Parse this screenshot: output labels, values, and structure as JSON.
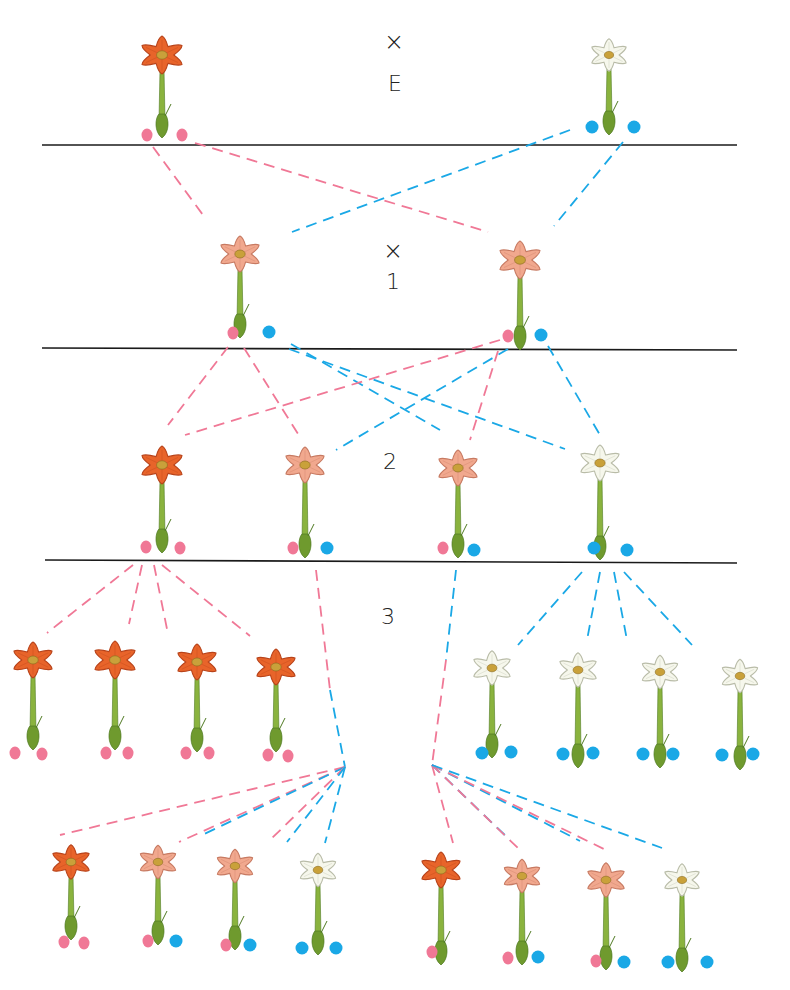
{
  "colors": {
    "red_allele": "#f07896",
    "white_allele": "#1aa8e6",
    "red_petal": "#e8642a",
    "red_petal_dark": "#b8431a",
    "pink_petal": "#f1a88e",
    "pink_petal_dark": "#c77a62",
    "white_petal": "#f6f7ec",
    "white_petal_dark": "#b9bca8",
    "stem": "#8ab33e",
    "stem_dark": "#4f7a22",
    "center": "#c9a13a",
    "divider": "#1a1a1a"
  },
  "labels": {
    "cross_symbol_1": "×",
    "parent_label": "E",
    "cross_symbol_2": "×",
    "gen1_label": "1",
    "gen2_label": "2",
    "gen3_label": "3"
  },
  "dividers": [
    {
      "x1": 42,
      "y1": 145,
      "x2": 737,
      "y2": 145
    },
    {
      "x1": 42,
      "y1": 348,
      "x2": 737,
      "y2": 350
    },
    {
      "x1": 45,
      "y1": 560,
      "x2": 737,
      "y2": 563
    }
  ],
  "flowers": [
    {
      "id": "P-red",
      "generation": "E",
      "color": "red",
      "x": 162,
      "y": 55,
      "stemBottom": 138,
      "size": 42,
      "alleles": [
        "red",
        "red"
      ],
      "dots": [
        [
          147,
          135
        ],
        [
          182,
          135
        ]
      ]
    },
    {
      "id": "P-white",
      "generation": "E",
      "color": "white",
      "x": 609,
      "y": 55,
      "stemBottom": 135,
      "size": 36,
      "alleles": [
        "white",
        "white"
      ],
      "dots": [
        [
          592,
          127
        ],
        [
          634,
          127
        ]
      ]
    },
    {
      "id": "F1-a",
      "generation": "1",
      "color": "pink",
      "x": 240,
      "y": 254,
      "stemBottom": 338,
      "size": 40,
      "alleles": [
        "red",
        "white"
      ],
      "dots": [
        [
          233,
          333
        ],
        [
          269,
          332
        ]
      ]
    },
    {
      "id": "F1-b",
      "generation": "1",
      "color": "pink",
      "x": 520,
      "y": 260,
      "stemBottom": 350,
      "size": 42,
      "alleles": [
        "red",
        "white"
      ],
      "dots": [
        [
          508,
          336
        ],
        [
          541,
          335
        ]
      ]
    },
    {
      "id": "F2-a",
      "generation": "2",
      "color": "red",
      "x": 162,
      "y": 465,
      "stemBottom": 553,
      "size": 42,
      "alleles": [
        "red",
        "red"
      ],
      "dots": [
        [
          146,
          547
        ],
        [
          180,
          548
        ]
      ]
    },
    {
      "id": "F2-b",
      "generation": "2",
      "color": "pink",
      "x": 305,
      "y": 465,
      "stemBottom": 558,
      "size": 40,
      "alleles": [
        "red",
        "white"
      ],
      "dots": [
        [
          293,
          548
        ],
        [
          327,
          548
        ]
      ]
    },
    {
      "id": "F2-c",
      "generation": "2",
      "color": "pink",
      "x": 458,
      "y": 468,
      "stemBottom": 558,
      "size": 40,
      "alleles": [
        "red",
        "white"
      ],
      "dots": [
        [
          443,
          548
        ],
        [
          474,
          550
        ]
      ]
    },
    {
      "id": "F2-d",
      "generation": "2",
      "color": "white",
      "x": 600,
      "y": 463,
      "stemBottom": 560,
      "size": 40,
      "alleles": [
        "white",
        "white"
      ],
      "dots": [
        [
          594,
          548
        ],
        [
          627,
          550
        ]
      ]
    },
    {
      "id": "F3-r1",
      "generation": "3",
      "color": "red",
      "x": 33,
      "y": 660,
      "stemBottom": 750,
      "size": 40,
      "alleles": [
        "red",
        "red"
      ],
      "dots": [
        [
          15,
          753
        ],
        [
          42,
          754
        ]
      ]
    },
    {
      "id": "F3-r2",
      "generation": "3",
      "color": "red",
      "x": 115,
      "y": 660,
      "stemBottom": 750,
      "size": 42,
      "alleles": [
        "red",
        "red"
      ],
      "dots": [
        [
          106,
          753
        ],
        [
          128,
          753
        ]
      ]
    },
    {
      "id": "F3-r3",
      "generation": "3",
      "color": "red",
      "x": 197,
      "y": 662,
      "stemBottom": 752,
      "size": 40,
      "alleles": [
        "red",
        "red"
      ],
      "dots": [
        [
          186,
          753
        ],
        [
          209,
          753
        ]
      ]
    },
    {
      "id": "F3-r4",
      "generation": "3",
      "color": "red",
      "x": 276,
      "y": 667,
      "stemBottom": 752,
      "size": 40,
      "alleles": [
        "red",
        "red"
      ],
      "dots": [
        [
          268,
          755
        ],
        [
          288,
          756
        ]
      ]
    },
    {
      "id": "F3-w1",
      "generation": "3",
      "color": "white",
      "x": 492,
      "y": 668,
      "stemBottom": 758,
      "size": 38,
      "alleles": [
        "white",
        "white"
      ],
      "dots": [
        [
          482,
          753
        ],
        [
          511,
          752
        ]
      ]
    },
    {
      "id": "F3-w2",
      "generation": "3",
      "color": "white",
      "x": 578,
      "y": 670,
      "stemBottom": 768,
      "size": 38,
      "alleles": [
        "white",
        "white"
      ],
      "dots": [
        [
          563,
          754
        ],
        [
          593,
          753
        ]
      ]
    },
    {
      "id": "F3-w3",
      "generation": "3",
      "color": "white",
      "x": 660,
      "y": 672,
      "stemBottom": 768,
      "size": 37,
      "alleles": [
        "white",
        "white"
      ],
      "dots": [
        [
          643,
          754
        ],
        [
          673,
          754
        ]
      ]
    },
    {
      "id": "F3-w4",
      "generation": "3",
      "color": "white",
      "x": 740,
      "y": 676,
      "stemBottom": 770,
      "size": 37,
      "alleles": [
        "white",
        "white"
      ],
      "dots": [
        [
          722,
          755
        ],
        [
          753,
          754
        ]
      ]
    },
    {
      "id": "F3-a1",
      "generation": "3",
      "color": "red",
      "x": 71,
      "y": 862,
      "stemBottom": 940,
      "size": 38,
      "alleles": [
        "red",
        "red"
      ],
      "dots": [
        [
          64,
          942
        ],
        [
          84,
          943
        ]
      ]
    },
    {
      "id": "F3-a2",
      "generation": "3",
      "color": "pink",
      "x": 158,
      "y": 862,
      "stemBottom": 945,
      "size": 37,
      "alleles": [
        "red",
        "white"
      ],
      "dots": [
        [
          148,
          941
        ],
        [
          176,
          941
        ]
      ]
    },
    {
      "id": "F3-a3",
      "generation": "3",
      "color": "pink",
      "x": 235,
      "y": 866,
      "stemBottom": 950,
      "size": 37,
      "alleles": [
        "red",
        "white"
      ],
      "dots": [
        [
          226,
          945
        ],
        [
          250,
          945
        ]
      ]
    },
    {
      "id": "F3-a4",
      "generation": "3",
      "color": "white",
      "x": 318,
      "y": 870,
      "stemBottom": 955,
      "size": 37,
      "alleles": [
        "white",
        "white"
      ],
      "dots": [
        [
          302,
          948
        ],
        [
          336,
          948
        ]
      ]
    },
    {
      "id": "F3-b1",
      "generation": "3",
      "color": "red",
      "x": 441,
      "y": 870,
      "stemBottom": 965,
      "size": 40,
      "alleles": [
        "red"
      ],
      "dots": [
        [
          432,
          952
        ]
      ]
    },
    {
      "id": "F3-b2",
      "generation": "3",
      "color": "pink",
      "x": 522,
      "y": 876,
      "stemBottom": 965,
      "size": 37,
      "alleles": [
        "red",
        "white"
      ],
      "dots": [
        [
          508,
          958
        ],
        [
          538,
          957
        ]
      ]
    },
    {
      "id": "F3-b3",
      "generation": "3",
      "color": "pink",
      "x": 606,
      "y": 880,
      "stemBottom": 970,
      "size": 38,
      "alleles": [
        "red",
        "white"
      ],
      "dots": [
        [
          596,
          961
        ],
        [
          624,
          962
        ]
      ]
    },
    {
      "id": "F3-b4",
      "generation": "3",
      "color": "white",
      "x": 682,
      "y": 880,
      "stemBottom": 972,
      "size": 36,
      "alleles": [
        "white",
        "white"
      ],
      "dots": [
        [
          668,
          962
        ],
        [
          707,
          962
        ]
      ]
    }
  ],
  "connections": [
    {
      "color": "red",
      "x1": 153,
      "y1": 147,
      "x2": 203,
      "y2": 215
    },
    {
      "color": "red",
      "x1": 195,
      "y1": 143,
      "x2": 488,
      "y2": 232
    },
    {
      "color": "white",
      "x1": 570,
      "y1": 130,
      "x2": 292,
      "y2": 232
    },
    {
      "color": "white",
      "x1": 623,
      "y1": 142,
      "x2": 554,
      "y2": 226
    },
    {
      "color": "red",
      "x1": 228,
      "y1": 347,
      "x2": 168,
      "y2": 425
    },
    {
      "color": "red",
      "x1": 244,
      "y1": 348,
      "x2": 300,
      "y2": 437
    },
    {
      "color": "white",
      "x1": 291,
      "y1": 344,
      "x2": 440,
      "y2": 430
    },
    {
      "color": "white",
      "x1": 289,
      "y1": 349,
      "x2": 565,
      "y2": 449
    },
    {
      "color": "red",
      "x1": 500,
      "y1": 340,
      "x2": 185,
      "y2": 435
    },
    {
      "color": "white",
      "x1": 508,
      "y1": 349,
      "x2": 336,
      "y2": 450
    },
    {
      "color": "red",
      "x1": 498,
      "y1": 351,
      "x2": 470,
      "y2": 440
    },
    {
      "color": "white",
      "x1": 548,
      "y1": 346,
      "x2": 600,
      "y2": 435
    },
    {
      "color": "red",
      "x1": 133,
      "y1": 565,
      "x2": 47,
      "y2": 633
    },
    {
      "color": "red",
      "x1": 142,
      "y1": 565,
      "x2": 129,
      "y2": 624
    },
    {
      "color": "red",
      "x1": 154,
      "y1": 565,
      "x2": 167,
      "y2": 629
    },
    {
      "color": "red",
      "x1": 162,
      "y1": 565,
      "x2": 250,
      "y2": 636
    },
    {
      "color": "white",
      "x1": 582,
      "y1": 572,
      "x2": 518,
      "y2": 645
    },
    {
      "color": "white",
      "x1": 600,
      "y1": 572,
      "x2": 587,
      "y2": 640
    },
    {
      "color": "white",
      "x1": 614,
      "y1": 572,
      "x2": 627,
      "y2": 640
    },
    {
      "color": "white",
      "x1": 624,
      "y1": 572,
      "x2": 692,
      "y2": 645
    },
    {
      "color": "red",
      "x1": 316,
      "y1": 570,
      "x2": 330,
      "y2": 690
    },
    {
      "color": "white",
      "x1": 330,
      "y1": 690,
      "x2": 345,
      "y2": 767
    },
    {
      "color": "white",
      "x1": 456,
      "y1": 570,
      "x2": 446,
      "y2": 660
    },
    {
      "color": "red",
      "x1": 446,
      "y1": 660,
      "x2": 432,
      "y2": 765
    },
    {
      "color": "red",
      "x1": 345,
      "y1": 767,
      "x2": 60,
      "y2": 835
    },
    {
      "color": "red",
      "x1": 345,
      "y1": 767,
      "x2": 179,
      "y2": 842
    },
    {
      "color": "white",
      "x1": 345,
      "y1": 767,
      "x2": 200,
      "y2": 836
    },
    {
      "color": "red",
      "x1": 345,
      "y1": 767,
      "x2": 268,
      "y2": 842
    },
    {
      "color": "white",
      "x1": 345,
      "y1": 767,
      "x2": 287,
      "y2": 842
    },
    {
      "color": "white",
      "x1": 345,
      "y1": 767,
      "x2": 325,
      "y2": 843
    },
    {
      "color": "red",
      "x1": 432,
      "y1": 765,
      "x2": 453,
      "y2": 843
    },
    {
      "color": "white",
      "x1": 432,
      "y1": 765,
      "x2": 510,
      "y2": 840
    },
    {
      "color": "red",
      "x1": 432,
      "y1": 765,
      "x2": 520,
      "y2": 850
    },
    {
      "color": "white",
      "x1": 432,
      "y1": 765,
      "x2": 580,
      "y2": 841
    },
    {
      "color": "red",
      "x1": 432,
      "y1": 765,
      "x2": 608,
      "y2": 851
    },
    {
      "color": "white",
      "x1": 432,
      "y1": 765,
      "x2": 662,
      "y2": 848
    }
  ]
}
